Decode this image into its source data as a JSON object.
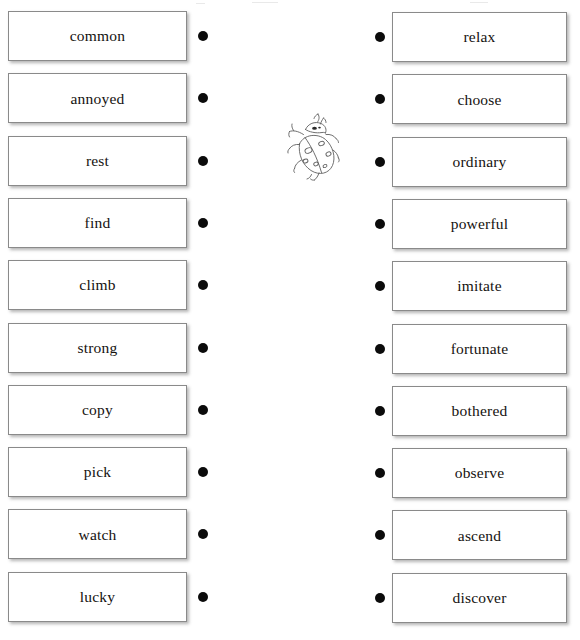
{
  "worksheet": {
    "type": "vocabulary-matching",
    "background_color": "#ffffff",
    "card_border_color": "#8a8a8a",
    "card_fill_color": "#ffffff",
    "text_color": "#15120f",
    "bullet_color": "#0b0b0b",
    "illustration": {
      "name": "ladybug-illustration",
      "label": "ladybug",
      "stroke_color": "#5f5f5f"
    },
    "left_column": {
      "name": "left-word-column",
      "items": [
        {
          "label": "common"
        },
        {
          "label": "annoyed"
        },
        {
          "label": "rest"
        },
        {
          "label": "find"
        },
        {
          "label": "climb"
        },
        {
          "label": "strong"
        },
        {
          "label": "copy"
        },
        {
          "label": "pick"
        },
        {
          "label": "watch"
        },
        {
          "label": "lucky"
        }
      ]
    },
    "right_column": {
      "name": "right-word-column",
      "items": [
        {
          "label": "relax"
        },
        {
          "label": "choose"
        },
        {
          "label": "ordinary"
        },
        {
          "label": "powerful"
        },
        {
          "label": "imitate"
        },
        {
          "label": "fortunate"
        },
        {
          "label": "bothered"
        },
        {
          "label": "observe"
        },
        {
          "label": "ascend"
        },
        {
          "label": "discover"
        }
      ]
    }
  }
}
